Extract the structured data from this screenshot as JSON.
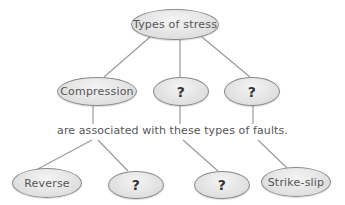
{
  "diagram": {
    "title_node": {
      "label": "Types of stress"
    },
    "stress_types": [
      {
        "label": "Compression"
      },
      {
        "label": "?"
      },
      {
        "label": "?"
      }
    ],
    "connector_text": "are associated with these types of faults.",
    "fault_types": [
      {
        "label": "Reverse"
      },
      {
        "label": "?"
      },
      {
        "label": "?"
      },
      {
        "label": "Strike-slip"
      }
    ],
    "colors": {
      "node_fill": "#e2e2e2",
      "node_border": "#8a8a8a",
      "line": "#9a9a9a",
      "text": "#555555"
    }
  }
}
